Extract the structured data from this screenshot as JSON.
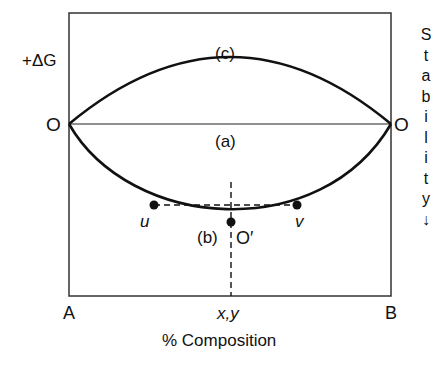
{
  "diagram": {
    "y_axis_label": "+ΔG",
    "origin_left": "O",
    "origin_right": "O",
    "curve_labels": {
      "c": "(c)",
      "a": "(a)",
      "b": "(b)"
    },
    "point_labels": {
      "u": "u",
      "v": "v",
      "o_prime": "O′"
    },
    "x_left": "A",
    "x_right": "B",
    "x_mid": "x,y",
    "x_axis_title": "% Composition",
    "stability_letters": [
      "S",
      "t",
      "a",
      "b",
      "i",
      "l",
      "i",
      "t",
      "y",
      "↓"
    ]
  }
}
